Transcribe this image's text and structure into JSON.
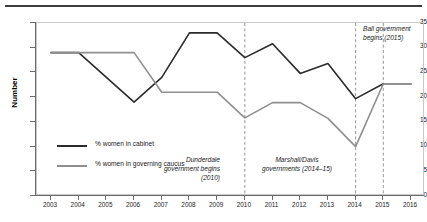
{
  "chart_data": {
    "type": "line",
    "title": "",
    "xlabel": "",
    "ylabel": "Number",
    "x": [
      2003,
      2004,
      2005,
      2006,
      2007,
      2008,
      2009,
      2010,
      2011,
      2012,
      2013,
      2014,
      2015,
      2016
    ],
    "categories": [
      "2003",
      "2004",
      "2005",
      "2006",
      "2007",
      "2008",
      "2009",
      "2010",
      "2011",
      "2012",
      "2013",
      "2014",
      "2015",
      "2016"
    ],
    "ylim": [
      0,
      35
    ],
    "ytick_values": [
      0,
      5,
      10,
      15,
      20,
      25,
      30,
      35
    ],
    "grid": false,
    "legend_position": "inside-lower-left",
    "series": [
      {
        "name": "% women in cabinet",
        "color": "#2b2b2b",
        "values": [
          29,
          29,
          24,
          19,
          24,
          33,
          33,
          28,
          30.8,
          24.8,
          26.8,
          19.7,
          22.7,
          22.7
        ]
      },
      {
        "name": "% women in governing caucus",
        "color": "#8f8f8f",
        "values": [
          29,
          29,
          29,
          29,
          21,
          21,
          21,
          15.8,
          18.9,
          18.9,
          15.7,
          10,
          22.7,
          22.7
        ]
      }
    ],
    "annotations": [
      {
        "text": "Dunderdale government begins (2010)",
        "at_x": 2010,
        "marker": "dashed-vertical"
      },
      {
        "text": "Marshall/Davis governments (2014–15)",
        "at_x": 2014,
        "marker": "dashed-vertical"
      },
      {
        "text": "Ball government begins (2015)",
        "at_x": 2015,
        "marker": "dashed-vertical"
      }
    ]
  },
  "yaxis": {
    "title": "Number",
    "ticks": [
      "35",
      "30",
      "25",
      "20",
      "15",
      "10",
      "5",
      "0"
    ]
  },
  "xaxis": {
    "ticks": [
      "2003",
      "2004",
      "2005",
      "2006",
      "2007",
      "2008",
      "2009",
      "2010",
      "2011",
      "2012",
      "2013",
      "2014",
      "2015",
      "2016"
    ]
  },
  "legend": {
    "items": [
      {
        "label": "% women in cabinet",
        "color": "#2b2b2b"
      },
      {
        "label": "% women in governing caucus",
        "color": "#8f8f8f"
      }
    ]
  },
  "annotations": {
    "dunderdale": "Dunderdale government begins (2010)",
    "marshall": "Marshall/Davis governments (2014–15)",
    "ball": "Ball government begins (2015)"
  },
  "colors": {
    "cabinet_line": "#2b2b2b",
    "caucus_line": "#8f8f8f",
    "axis": "#6b6b6b",
    "plot_border": "#c8c8c8",
    "rule": "#3d3d3d"
  }
}
